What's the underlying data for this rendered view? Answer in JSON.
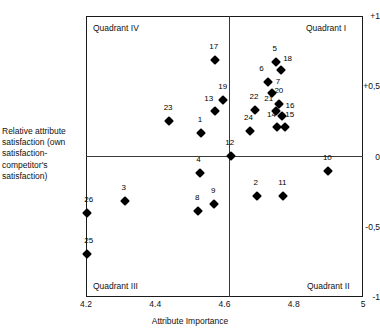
{
  "chart_data": {
    "type": "scatter",
    "title": "",
    "xlabel": "Attribute Importance",
    "ylabel": "Relative attribute satisfaction (own satisfaction-competitor's satisfaction)",
    "ylabel_lines": [
      "Relative attribute",
      "satisfaction (own",
      "satisfaction-",
      "competitor's",
      "satisfaction)"
    ],
    "xlim": [
      4.2,
      5.0
    ],
    "ylim": [
      -1,
      1
    ],
    "xticks": [
      "4.2",
      "4.4",
      "4.6",
      "4.8",
      "5"
    ],
    "xtick_values": [
      4.2,
      4.4,
      4.6,
      4.8,
      5.0
    ],
    "yticks": [
      "+1",
      "+0,5",
      "0",
      "-0,5",
      "-1"
    ],
    "ytick_values": [
      1,
      0.5,
      0,
      -0.5,
      -1
    ],
    "grid": false,
    "legend": null,
    "reference_lines": {
      "vertical_x": 4.6,
      "horizontal_y": 0
    },
    "quadrants": [
      {
        "name": "quadrant-top-left",
        "label": "Quadrant IV"
      },
      {
        "name": "quadrant-top-right",
        "label": "Quadrant I"
      },
      {
        "name": "quadrant-bottom-left",
        "label": "Quadrant III"
      },
      {
        "name": "quadrant-bottom-right",
        "label": "Quadrant II"
      }
    ],
    "points": [
      {
        "label": "1",
        "x": 4.532,
        "y": 0.17,
        "lx": -1,
        "ly": -5
      },
      {
        "label": "2",
        "x": 4.693,
        "y": -0.28,
        "lx": -1,
        "ly": -5
      },
      {
        "label": "3",
        "x": 4.312,
        "y": -0.32,
        "lx": -1,
        "ly": -5
      },
      {
        "label": "4",
        "x": 4.528,
        "y": -0.12,
        "lx": -1,
        "ly": -5
      },
      {
        "label": "5",
        "x": 4.748,
        "y": 0.67,
        "lx": -1,
        "ly": -5
      },
      {
        "label": "6",
        "x": 4.727,
        "y": 0.53,
        "lx": -7,
        "ly": -5
      },
      {
        "label": "7",
        "x": 4.737,
        "y": 0.455,
        "lx": 6,
        "ly": -3
      },
      {
        "label": "8",
        "x": 4.524,
        "y": -0.39,
        "lx": -1,
        "ly": -5
      },
      {
        "label": "9",
        "x": 4.57,
        "y": -0.34,
        "lx": -1,
        "ly": -5
      },
      {
        "label": "10",
        "x": 4.9,
        "y": -0.105,
        "lx": -1,
        "ly": -5
      },
      {
        "label": "11",
        "x": 4.77,
        "y": -0.28,
        "lx": -1,
        "ly": -5
      },
      {
        "label": "12",
        "x": 4.618,
        "y": 0.005,
        "lx": -1,
        "ly": -5
      },
      {
        "label": "13",
        "x": 4.572,
        "y": 0.325,
        "lx": -6,
        "ly": -4
      },
      {
        "label": "14",
        "x": 4.753,
        "y": 0.21,
        "lx": -6,
        "ly": -4
      },
      {
        "label": "15",
        "x": 4.774,
        "y": 0.21,
        "lx": 5,
        "ly": -4
      },
      {
        "label": "16",
        "x": 4.766,
        "y": 0.29,
        "lx": 8,
        "ly": -2
      },
      {
        "label": "17",
        "x": 4.572,
        "y": 0.685,
        "lx": -1,
        "ly": -5
      },
      {
        "label": "18",
        "x": 4.762,
        "y": 0.615,
        "lx": 7,
        "ly": -3
      },
      {
        "label": "19",
        "x": 4.595,
        "y": 0.4,
        "lx": 0,
        "ly": -5
      },
      {
        "label": "20",
        "x": 4.757,
        "y": 0.375,
        "lx": 0,
        "ly": -5
      },
      {
        "label": "21",
        "x": 4.748,
        "y": 0.325,
        "lx": -7,
        "ly": -4
      },
      {
        "label": "22",
        "x": 4.688,
        "y": 0.33,
        "lx": -1,
        "ly": -5
      },
      {
        "label": "23",
        "x": 4.44,
        "y": 0.255,
        "lx": -1,
        "ly": -5
      },
      {
        "label": "24",
        "x": 4.675,
        "y": 0.18,
        "lx": -2,
        "ly": -5
      },
      {
        "label": "25",
        "x": 4.202,
        "y": -0.695,
        "lx": 2,
        "ly": -5
      },
      {
        "label": "26",
        "x": 4.202,
        "y": -0.4,
        "lx": 2,
        "ly": -5
      }
    ]
  }
}
